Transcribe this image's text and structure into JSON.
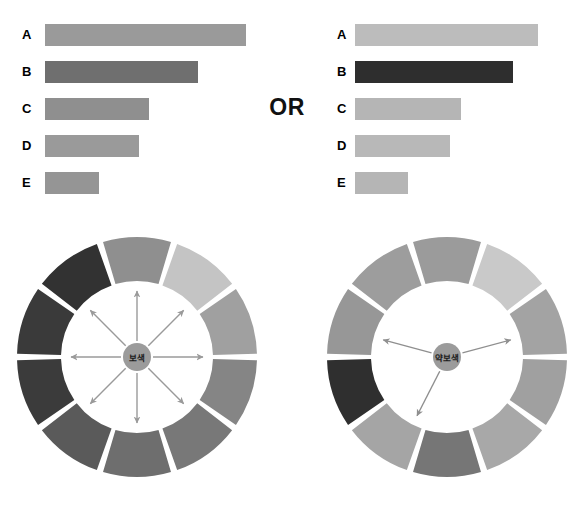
{
  "page": {
    "background": "#ffffff",
    "divider_label": "OR"
  },
  "chart_data": [
    {
      "type": "bar",
      "id": "left-bar-chart",
      "orientation": "horizontal",
      "title": "",
      "xlabel": "",
      "ylabel": "",
      "grid": false,
      "legend": "none",
      "categories": [
        "A",
        "B",
        "C",
        "D",
        "E"
      ],
      "values": [
        100,
        76,
        52,
        47,
        27
      ],
      "xlim": [
        0,
        100
      ],
      "bar_colors": [
        "#9a9a9a",
        "#6f6f6f",
        "#8f8f8f",
        "#9a9a9a",
        "#959595"
      ],
      "bars": [
        {
          "label": "A",
          "value": 100,
          "color": "#9a9a9a",
          "pixel_width": 201
        },
        {
          "label": "B",
          "value": 76,
          "color": "#6f6f6f",
          "pixel_width": 153
        },
        {
          "label": "C",
          "value": 52,
          "color": "#8f8f8f",
          "pixel_width": 104
        },
        {
          "label": "D",
          "value": 47,
          "color": "#9a9a9a",
          "pixel_width": 94
        },
        {
          "label": "E",
          "value": 27,
          "color": "#959595",
          "pixel_width": 54
        }
      ]
    },
    {
      "type": "bar",
      "id": "right-bar-chart",
      "orientation": "horizontal",
      "title": "",
      "xlabel": "",
      "ylabel": "",
      "grid": false,
      "legend": "none",
      "categories": [
        "A",
        "B",
        "C",
        "D",
        "E"
      ],
      "values": [
        100,
        86,
        58,
        52,
        29
      ],
      "xlim": [
        0,
        100
      ],
      "bar_colors": [
        "#bcbcbc",
        "#2e2e2e",
        "#b5b5b5",
        "#b8b8b8",
        "#b5b5b5"
      ],
      "bars": [
        {
          "label": "A",
          "value": 100,
          "color": "#bcbcbc",
          "pixel_width": 183
        },
        {
          "label": "B",
          "value": 86,
          "color": "#2e2e2e",
          "pixel_width": 158
        },
        {
          "label": "C",
          "value": 58,
          "color": "#b5b5b5",
          "pixel_width": 106
        },
        {
          "label": "D",
          "value": 52,
          "color": "#b8b8b8",
          "pixel_width": 95
        },
        {
          "label": "E",
          "value": 29,
          "color": "#b5b5b5",
          "pixel_width": 53
        }
      ]
    }
  ],
  "wheels": [
    {
      "id": "wheel-complementary",
      "hub_label": "보색",
      "hub_color": "#9b9b9b",
      "arrow_count": 8,
      "arrow_color": "#9a9a9a",
      "segment_count": 10,
      "segments": [
        {
          "index": 0,
          "color": "#8f8f8f"
        },
        {
          "index": 1,
          "color": "#c4c4c4"
        },
        {
          "index": 2,
          "color": "#a0a0a0"
        },
        {
          "index": 3,
          "color": "#858585"
        },
        {
          "index": 4,
          "color": "#787878"
        },
        {
          "index": 5,
          "color": "#6e6e6e"
        },
        {
          "index": 6,
          "color": "#5a5a5a"
        },
        {
          "index": 7,
          "color": "#3b3b3b"
        },
        {
          "index": 8,
          "color": "#3a3a3a"
        },
        {
          "index": 9,
          "color": "#323232"
        }
      ]
    },
    {
      "id": "wheel-weak-complementary",
      "hub_label": "약보색",
      "hub_color": "#9b9b9b",
      "arrow_count": 3,
      "arrow_color": "#8f8f8f",
      "segment_count": 10,
      "segments": [
        {
          "index": 0,
          "color": "#9b9b9b"
        },
        {
          "index": 1,
          "color": "#c9c9c9"
        },
        {
          "index": 2,
          "color": "#a3a3a3"
        },
        {
          "index": 3,
          "color": "#a0a0a0"
        },
        {
          "index": 4,
          "color": "#a8a8a8"
        },
        {
          "index": 5,
          "color": "#767676"
        },
        {
          "index": 6,
          "color": "#a5a5a5"
        },
        {
          "index": 7,
          "color": "#2f2f2f"
        },
        {
          "index": 8,
          "color": "#979797"
        },
        {
          "index": 9,
          "color": "#9d9d9d"
        }
      ]
    }
  ]
}
